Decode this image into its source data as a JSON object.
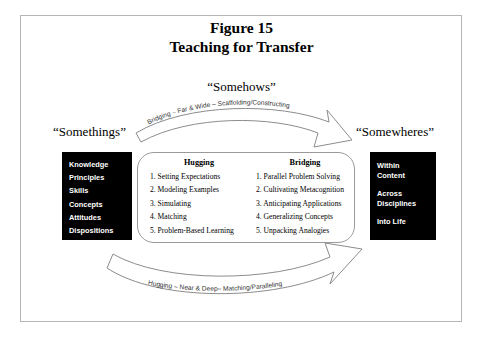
{
  "figure": {
    "title_line1": "Figure 15",
    "title_line2": "Teaching for Transfer"
  },
  "labels": {
    "somethings": "“Somethings”",
    "somehows": "“Somehows”",
    "somewheres": "“Somewheres”"
  },
  "left_box": {
    "items": [
      "Knowledge",
      "Principles",
      "Skills",
      "Concepts",
      "Attitudes",
      "Dispositions"
    ]
  },
  "right_box": {
    "groups": [
      "Within\nContent",
      "Across\nDisciplines",
      "Into Life"
    ],
    "g1_l1": "Within",
    "g1_l2": "Content",
    "g2_l1": "Across",
    "g2_l2": "Disciplines",
    "g3_l1": "Into Life"
  },
  "center": {
    "hugging": {
      "heading": "Hugging",
      "items": [
        "1. Setting Expectations",
        "2. Modeling Examples",
        "3. Simulating",
        "4. Matching",
        "5. Problem-Based Learning"
      ]
    },
    "bridging": {
      "heading": "Bridging",
      "items": [
        "1. Parallel Problem Solving",
        "2. Cultivating Metacognition",
        "3. Anticipating Applications",
        "4. Generalizing Concepts",
        "5. Unpacking Analogies"
      ]
    }
  },
  "arrows": {
    "top_label": "Bridging – Far & Wide – Scaffolding/Constructing",
    "bottom_label": "Hugging – Near & Deep– Matching/Paralleling"
  },
  "colors": {
    "frame_border": "#b5b5b5",
    "box_fill": "#000000",
    "box_text": "#ffffff",
    "center_border": "#9a9a9a",
    "arrow_stroke": "#8c8c8c"
  }
}
